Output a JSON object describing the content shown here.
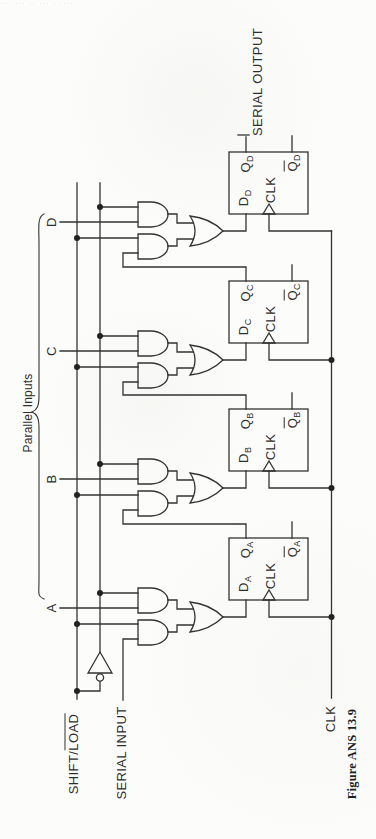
{
  "header_fragment": "·· ···· ·· ··· · ····",
  "caption": "Figure ANS 13.9",
  "labels": {
    "serial_output": "SERIAL OUTPUT",
    "serial_input": "SERIAL INPUT",
    "shift_load_pre": "SHIFT/",
    "shift_load_bar": "LOAD",
    "clk": "CLK",
    "parallel_inputs": "Parallel Inputs"
  },
  "stages": [
    {
      "letter": "D",
      "ff": {
        "d_main": "D",
        "d_sub": "D",
        "q_main": "Q",
        "q_sub": "D",
        "clk": "CLK",
        "qbar_main": "Q",
        "qbar_sub": "D"
      }
    },
    {
      "letter": "C",
      "ff": {
        "d_main": "D",
        "d_sub": "C",
        "q_main": "Q",
        "q_sub": "C",
        "clk": "CLK",
        "qbar_main": "Q",
        "qbar_sub": "C"
      }
    },
    {
      "letter": "B",
      "ff": {
        "d_main": "D",
        "d_sub": "B",
        "q_main": "Q",
        "q_sub": "B",
        "clk": "CLK",
        "qbar_main": "Q",
        "qbar_sub": "B"
      }
    },
    {
      "letter": "A",
      "ff": {
        "d_main": "D",
        "d_sub": "A",
        "q_main": "Q",
        "q_sub": "A",
        "clk": "CLK",
        "qbar_main": "Q",
        "qbar_sub": "A"
      }
    }
  ],
  "colors": {
    "line": "#333333",
    "bg": "#fcfcfa"
  }
}
